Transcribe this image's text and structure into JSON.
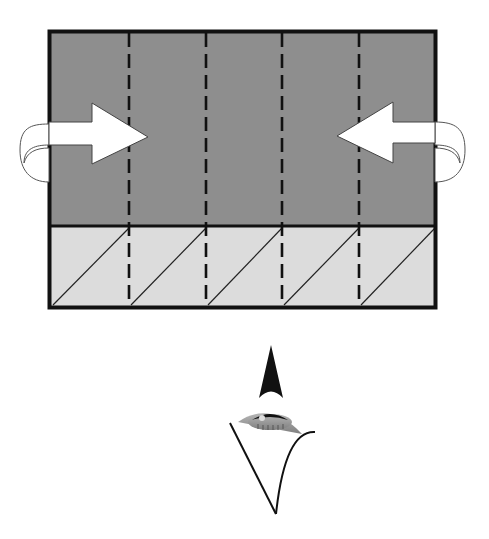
{
  "diagram": {
    "type": "folding-instruction",
    "colors": {
      "background": "#ffffff",
      "upper_panel": "#8e8e8e",
      "lower_panel": "#dcdcdc",
      "outline": "#111111",
      "arrow_fill": "#ffffff",
      "iris": "#9a9a9a"
    },
    "sheet": {
      "x": 48,
      "y": 30,
      "width": 389,
      "height": 279,
      "upper_panel": {
        "shade": "dark",
        "columns": 5
      },
      "lower_panel": {
        "shade": "light",
        "columns": 5,
        "diagonal_creases": 5
      },
      "dashed_fold_lines": 4
    },
    "arrows": [
      {
        "name": "left-fold-arrow",
        "direction": "right"
      },
      {
        "name": "right-fold-arrow",
        "direction": "left"
      }
    ],
    "view_indicator": {
      "symbol": "eye",
      "pointer": "up-arrowhead"
    }
  }
}
